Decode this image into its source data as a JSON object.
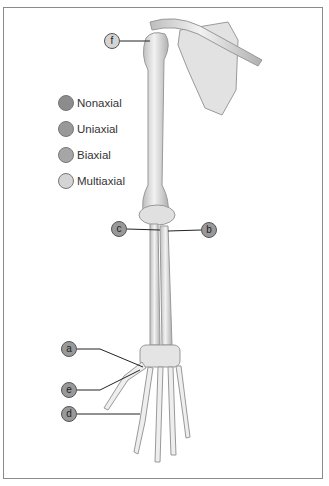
{
  "legend": {
    "items": [
      {
        "label": "Nonaxial",
        "color": "#8c8c8c"
      },
      {
        "label": "Uniaxial",
        "color": "#999999"
      },
      {
        "label": "Biaxial",
        "color": "#a6a6a6"
      },
      {
        "label": "Multiaxial",
        "color": "#d4d4d4"
      }
    ]
  },
  "markers": [
    {
      "id": "f",
      "label": "f",
      "x": 104,
      "y": 33,
      "color": "#d4d4d4",
      "line": [
        120,
        41,
        150,
        41
      ]
    },
    {
      "id": "c",
      "label": "c",
      "x": 111,
      "y": 221,
      "color": "#999999",
      "line": [
        127,
        229,
        160,
        230
      ]
    },
    {
      "id": "b",
      "label": "b",
      "x": 201,
      "y": 222,
      "color": "#999999",
      "line": [
        201,
        230,
        170,
        230
      ]
    },
    {
      "id": "a",
      "label": "a",
      "x": 61,
      "y": 341,
      "color": "#999999",
      "line": [
        77,
        349,
        100,
        349
      ]
    },
    {
      "id": "e",
      "label": "e",
      "x": 61,
      "y": 382,
      "color": "#999999",
      "line": [
        77,
        390,
        100,
        390
      ]
    },
    {
      "id": "d",
      "label": "d",
      "x": 61,
      "y": 406,
      "color": "#999999",
      "line": [
        77,
        414,
        140,
        414
      ]
    }
  ]
}
